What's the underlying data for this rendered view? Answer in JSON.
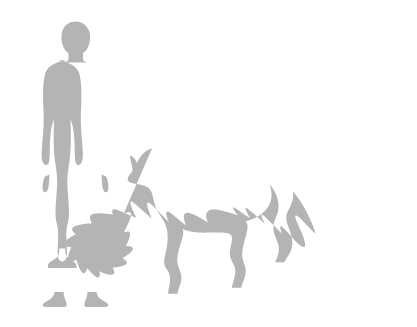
{
  "diagram": {
    "kind": "size-comparison-silhouette",
    "background_color": "#ffffff",
    "silhouette_color": "#b4b4b4",
    "silhouette_texture": "fine woven dither",
    "canvas": {
      "width": 417,
      "height": 327
    },
    "baseline_y": 306,
    "title": "",
    "caption": "Size comparison silhouette: standing human figure beside a walking big cat",
    "labels": [],
    "figures": [
      {
        "id": "human-figure",
        "name": "human",
        "semantic": "adult-human-silhouette",
        "pose": "standing, facing viewer, arms at sides",
        "color": "#b4b4b4",
        "bbox": {
          "x": 43,
          "y": 21,
          "width": 77,
          "height": 285
        },
        "height_px": 285,
        "label": ""
      },
      {
        "id": "big-cat-figure",
        "name": "big cat",
        "semantic": "cheetah-silhouette",
        "pose": "walking, profile facing left",
        "color": "#b4b4b4",
        "bbox": {
          "x": 128,
          "y": 148,
          "width": 265,
          "height": 158
        },
        "height_px": 158,
        "label": ""
      }
    ],
    "scale_ratio_text": ""
  }
}
